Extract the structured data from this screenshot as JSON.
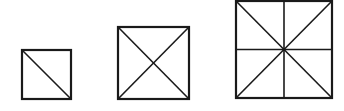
{
  "diagram": {
    "stroke_color": "#1a1a1a",
    "background": "#ffffff",
    "figures": [
      {
        "name": "small-square",
        "x": 22,
        "y": 50,
        "size": 49,
        "divisions": [
          "diagonal-tl-br"
        ],
        "regions": 2
      },
      {
        "name": "medium-square",
        "x": 118,
        "y": 27,
        "size": 71,
        "divisions": [
          "diagonal-tl-br",
          "diagonal-tr-bl"
        ],
        "regions": 4
      },
      {
        "name": "large-square",
        "x": 236,
        "y": 2,
        "size": 96,
        "divisions": [
          "diagonal-tl-br",
          "diagonal-tr-bl",
          "vertical-midline",
          "horizontal-midline"
        ],
        "regions": 8
      }
    ]
  }
}
